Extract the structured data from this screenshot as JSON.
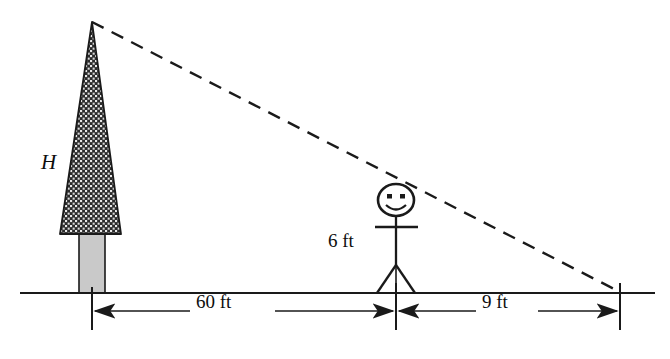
{
  "figure": {
    "background_color": "#ffffff",
    "line_color": "#1a1a1a",
    "canopy_fill": "#2b2b2b",
    "trunk_fill": "#c9c9c9"
  },
  "labels": {
    "tree_height": "H",
    "person_height": "6 ft",
    "distance_tree_to_person": "60 ft",
    "distance_person_to_tip": "9 ft"
  },
  "icons": {
    "tree": "tree-icon",
    "person": "stick-figure-icon",
    "sight_line": "dashed-sight-line",
    "ground": "ground-line"
  },
  "geometry": {
    "ground_y": 293,
    "tree_base_x": 92,
    "tree_apex_x": 92,
    "tree_apex_y": 22,
    "person_x": 396,
    "shadow_tip_x": 620
  }
}
